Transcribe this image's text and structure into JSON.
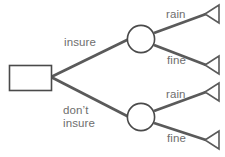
{
  "diagram": {
    "type": "decision-tree",
    "title": "",
    "colors": {
      "branch_stroke": "#5a5a5a",
      "node_stroke": "#4a4a4a",
      "label_text": "#6e6e6e",
      "background": "#ffffff"
    },
    "root": {
      "node_type": "decision",
      "shape": "rectangle",
      "label": ""
    },
    "branches": [
      {
        "label": "insure",
        "node_type": "chance",
        "shape": "circle",
        "outcomes": [
          {
            "label": "rain",
            "terminal": "payoff-triangle"
          },
          {
            "label": "fine",
            "terminal": "payoff-triangle"
          }
        ]
      },
      {
        "label": "don’t\ninsure",
        "node_type": "chance",
        "shape": "circle",
        "outcomes": [
          {
            "label": "rain",
            "terminal": "payoff-triangle"
          },
          {
            "label": "fine",
            "terminal": "payoff-triangle"
          }
        ]
      }
    ],
    "labels": {
      "insure": "insure",
      "dont_insure": "don’t\ninsure",
      "rain_top": "rain",
      "fine_top": "fine",
      "rain_bottom": "rain",
      "fine_bottom": "fine"
    }
  }
}
